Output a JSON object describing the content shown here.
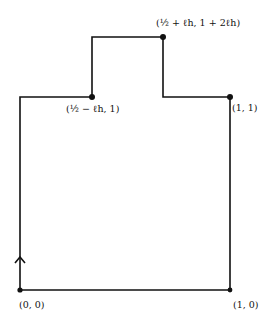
{
  "diagram": {
    "type": "piecewise-linear closed contour",
    "stroke_color": "#111111",
    "background": "#ffffff",
    "vertices": [
      {
        "id": "origin",
        "x": 20,
        "y": 290,
        "dot": true
      },
      {
        "id": "left-top",
        "x": 20,
        "y": 97,
        "dot": false
      },
      {
        "id": "notch-left-bottom",
        "x": 92,
        "y": 97,
        "dot": true
      },
      {
        "id": "notch-left-top",
        "x": 92,
        "y": 37,
        "dot": false
      },
      {
        "id": "notch-right-top",
        "x": 163,
        "y": 37,
        "dot": true
      },
      {
        "id": "notch-right-bottom",
        "x": 163,
        "y": 97,
        "dot": false
      },
      {
        "id": "right-top",
        "x": 230,
        "y": 97,
        "dot": true
      },
      {
        "id": "right-bottom",
        "x": 230,
        "y": 290,
        "dot": true
      }
    ],
    "labels": {
      "origin": "(0, 0)",
      "bottom_right": "(1, 0)",
      "top_right": "(1, 1)",
      "notch_left": "(½ − ℓh, 1)",
      "notch_top": "(½ + ℓh, 1 + 2ℓh)"
    },
    "orientation_arrow": {
      "x": 20,
      "y": 257,
      "direction": "up"
    }
  }
}
